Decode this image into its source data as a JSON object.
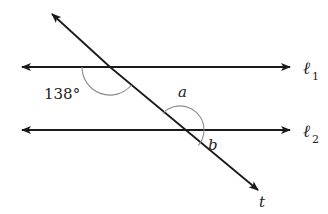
{
  "diagram": {
    "type": "parallel-lines-transversal",
    "colors": {
      "line": "#1a1a1a",
      "arc": "#8a8a8a",
      "text": "#222222"
    },
    "lines": [
      {
        "id": "l1",
        "label": "ℓ",
        "subscript": "1"
      },
      {
        "id": "l2",
        "label": "ℓ",
        "subscript": "2"
      },
      {
        "id": "t",
        "label": "t"
      }
    ],
    "angles": [
      {
        "id": "given",
        "label": "138°",
        "at": "l1-t intersection, lower-left"
      },
      {
        "id": "a",
        "label": "a",
        "at": "l2-t intersection, upper-right"
      },
      {
        "id": "b",
        "label": "b",
        "at": "l2-t intersection, lower-right"
      }
    ]
  }
}
